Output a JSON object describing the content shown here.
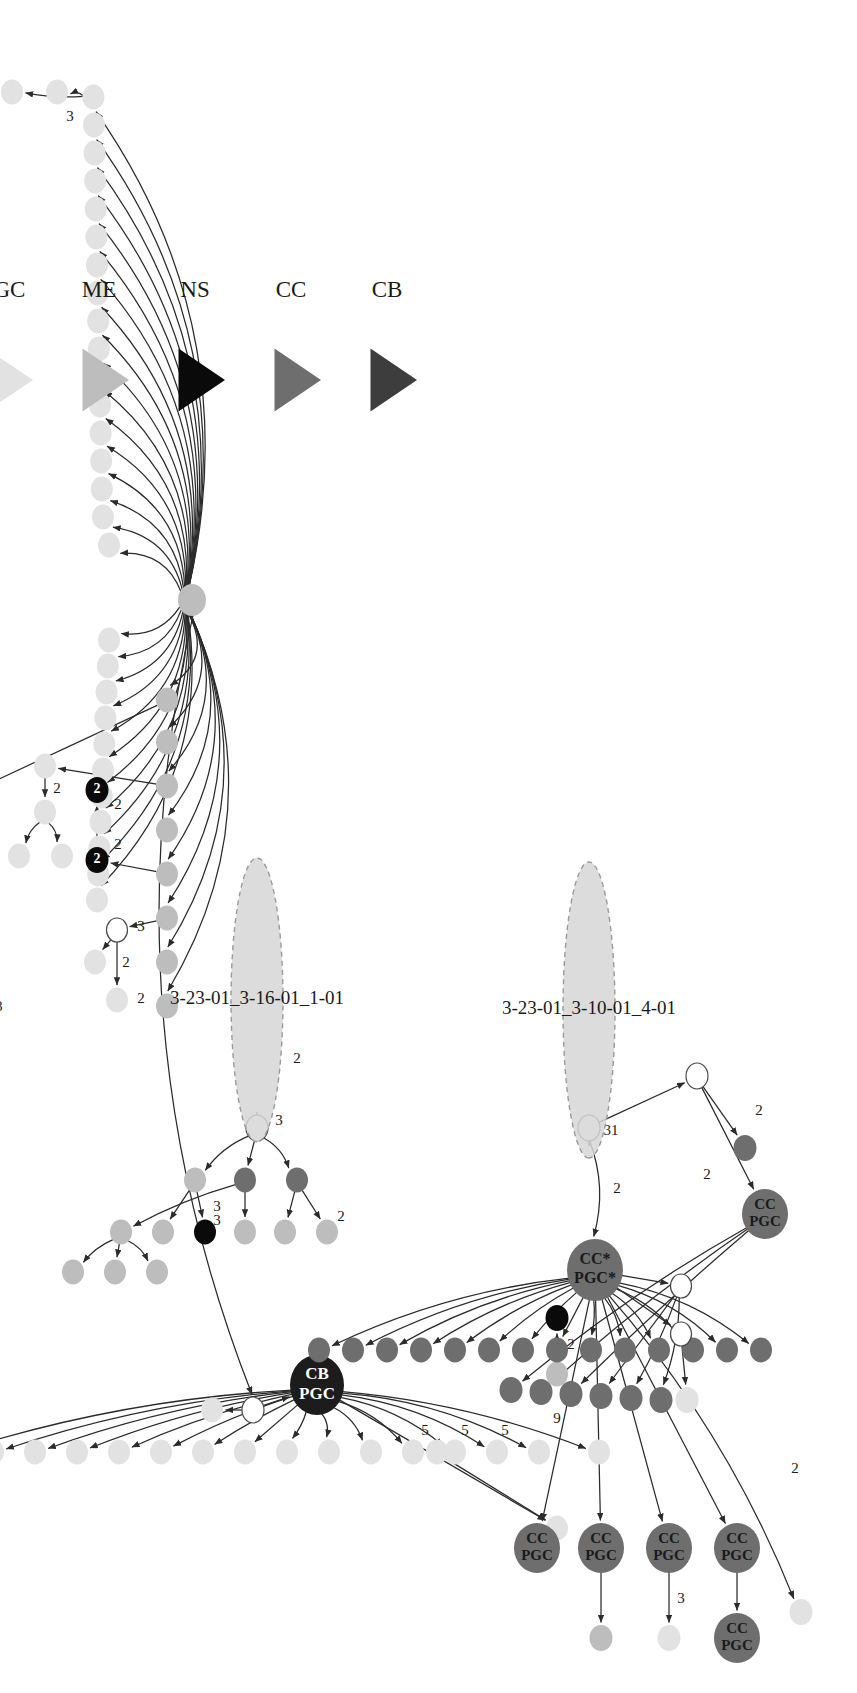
{
  "figure": {
    "type": "transmission-network-diagram",
    "orientation": "rotated-90-counterclockwise",
    "background": "#ffffff"
  },
  "palette": {
    "CB": "#3d3d3d",
    "CC": "#6e6e6e",
    "NS": "#0a0a0a",
    "ME": "#bdbdbd",
    "PGC": "#e2e2e2",
    "unknown": "#ffffff",
    "edge": "#2b2b2b",
    "cluster_fill": "#d6d6d6",
    "cluster_stroke": "#9a9a9a",
    "text_dark": "#1a1a1a",
    "text_light": "#ffffff"
  },
  "legend": {
    "items": [
      {
        "label": "CB",
        "color": "#3d3d3d"
      },
      {
        "label": "CC",
        "color": "#6e6e6e"
      },
      {
        "label": "NS",
        "color": "#0a0a0a"
      },
      {
        "label": "ME",
        "color": "#bdbdbd"
      },
      {
        "label": "PGC",
        "color": "#e2e2e2"
      }
    ]
  },
  "clusters": [
    {
      "id": "cluster-1",
      "label": "3-23-01_3-16-01_1-01",
      "edge_label": "3"
    },
    {
      "id": "cluster-2",
      "label": "3-23-01_3-10-01_4-01",
      "edge_label": "31"
    }
  ],
  "named_nodes": [
    {
      "id": "cb-pgc",
      "label_line1": "CB",
      "label_line2": "PGC",
      "color": "#1c1c1c",
      "text": "#ffffff"
    },
    {
      "id": "cc-pgc-star",
      "label_line1": "CC*",
      "label_line2": "PGC*",
      "color": "#6e6e6e",
      "text": "#1a1a1a"
    },
    {
      "id": "cc-pgc-a",
      "label_line1": "CC",
      "label_line2": "PGC",
      "color": "#6e6e6e",
      "text": "#1a1a1a"
    },
    {
      "id": "cc-pgc-b",
      "label_line1": "CC",
      "label_line2": "PGC",
      "color": "#6e6e6e",
      "text": "#1a1a1a"
    },
    {
      "id": "cc-pgc-c",
      "label_line1": "CC",
      "label_line2": "PGC",
      "color": "#6e6e6e",
      "text": "#1a1a1a"
    },
    {
      "id": "cc-pgc-d",
      "label_line1": "CC",
      "label_line2": "PGC",
      "color": "#6e6e6e",
      "text": "#1a1a1a"
    },
    {
      "id": "cc-pgc-e",
      "label_line1": "CC",
      "label_line2": "PGC",
      "color": "#6e6e6e",
      "text": "#1a1a1a"
    },
    {
      "id": "cc-pgc-f",
      "label_line1": "CC",
      "label_line2": "PGC",
      "color": "#6e6e6e",
      "text": "#1a1a1a"
    }
  ],
  "numeric_nodes": [
    {
      "id": "num-node-1",
      "label": "2",
      "color": "#0a0a0a",
      "text": "#ffffff"
    },
    {
      "id": "num-node-2",
      "label": "2",
      "color": "#0a0a0a",
      "text": "#ffffff"
    }
  ],
  "edge_labels": [
    "2",
    "9",
    "5",
    "5",
    "5",
    "2",
    "3",
    "3",
    "3",
    "2",
    "3",
    "2",
    "2",
    "2",
    "2",
    "2",
    "2",
    "2",
    "5",
    "4",
    "7",
    "11",
    "18",
    "6",
    "2",
    "3",
    "31",
    "2",
    "2",
    "2",
    "3",
    "2"
  ],
  "chart_data": {
    "type": "diagram",
    "title": "",
    "node_count_approx": 120,
    "series": [
      {
        "name": "CB",
        "color": "#3d3d3d"
      },
      {
        "name": "CC",
        "color": "#6e6e6e"
      },
      {
        "name": "NS",
        "color": "#0a0a0a"
      },
      {
        "name": "ME",
        "color": "#bdbdbd"
      },
      {
        "name": "PGC",
        "color": "#e2e2e2"
      }
    ]
  }
}
